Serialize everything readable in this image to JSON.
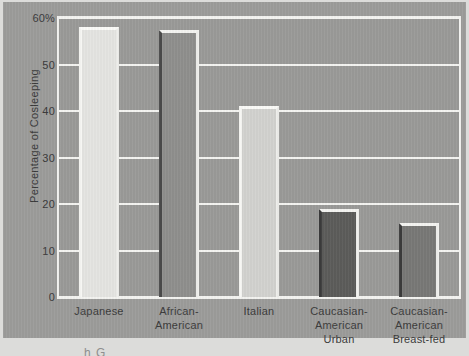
{
  "chart_data": {
    "type": "bar",
    "title": "",
    "xlabel": "",
    "ylabel": "Percentage of Cosleeping",
    "ylim": [
      0,
      60
    ],
    "ytick_labels": [
      "60%",
      "50",
      "40",
      "30",
      "20",
      "10",
      "0"
    ],
    "ytick_values": [
      60,
      50,
      40,
      30,
      20,
      10,
      0
    ],
    "grid": true,
    "legend": "none",
    "categories": [
      "Japanese",
      "African-American",
      "Italian",
      "Caucasian-American Urban",
      "Caucasian-American Breast-fed"
    ],
    "category_lines": [
      [
        "Japanese"
      ],
      [
        "African-American"
      ],
      [
        "Italian"
      ],
      [
        "Caucasian-",
        "American",
        "Urban"
      ],
      [
        "Caucasian-",
        "American",
        "Breast-fed"
      ]
    ],
    "values": [
      58,
      57.5,
      41,
      19,
      16
    ],
    "bar_colors": [
      "#e4e4e1",
      "#8f8f8d",
      "#d2d2cf",
      "#5c5c5a",
      "#787876"
    ],
    "bar_shades": [
      "light",
      "mid",
      "light",
      "dark",
      "dark"
    ],
    "plot_background": "#9a9a98",
    "gridline_color": "#f4f4f1",
    "figure_background": "#9c9c9a",
    "page_background": "#dcdcda",
    "text_color": "#3a3a3a"
  },
  "caption_fragment": "h G"
}
